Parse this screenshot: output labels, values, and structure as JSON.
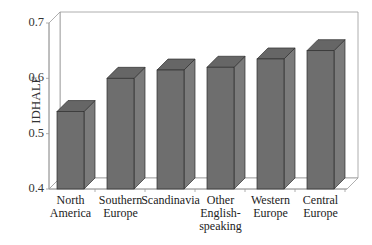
{
  "chart_data": {
    "type": "bar",
    "style": "3d",
    "title": "",
    "xlabel": "",
    "ylabel": "IDHALF",
    "ylim": [
      0.4,
      0.7
    ],
    "yticks": [
      "0.4",
      "0.5",
      "0.6",
      "0.7"
    ],
    "grid": false,
    "legend": null,
    "categories": [
      "North\nAmerica",
      "Southern\nEurope",
      "Scandinavia",
      "Other\nEnglish-\nspeaking",
      "Western\nEurope",
      "Central\nEurope"
    ],
    "values": [
      0.54,
      0.6,
      0.615,
      0.62,
      0.635,
      0.65
    ],
    "colors": {
      "front": "#6e6e6e",
      "side": "#7b7b7b",
      "top": "#666666",
      "edge": "#2f2f2f",
      "axis": "#9a9a9a"
    }
  }
}
